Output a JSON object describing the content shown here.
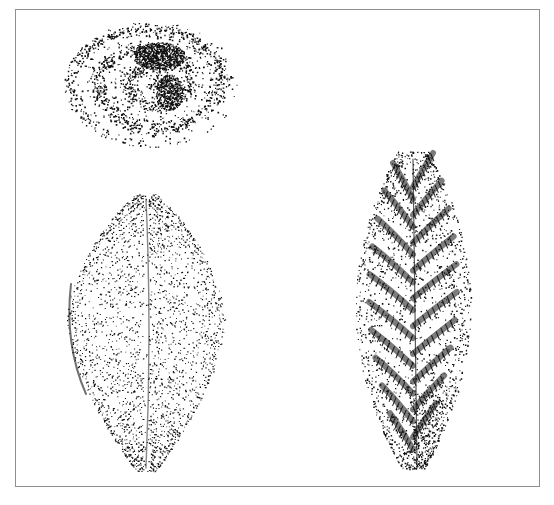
{
  "plate": {
    "background": "#ffffff",
    "border_color": "#8f8f8f",
    "ink_color": "#111111",
    "specimens": [
      {
        "name": "coiled-fossil",
        "description": "Stippled coiled (spiral) fossil impression, top-left",
        "cx": 150,
        "cy": 83,
        "rx": 87,
        "ry": 63
      },
      {
        "name": "oval-fossil-leaf",
        "description": "Broad ovate stippled fossil with fine radiating striations and central midline",
        "cx": 145,
        "cy": 330,
        "top": 193,
        "bottom": 470,
        "halfwidth": 80
      },
      {
        "name": "fern-frond-fossil",
        "description": "Elongate stippled fern-like frond fossil with alternating pinnae, right",
        "cx": 412,
        "cy": 310,
        "top": 150,
        "bottom": 468,
        "halfwidth": 55
      }
    ]
  }
}
